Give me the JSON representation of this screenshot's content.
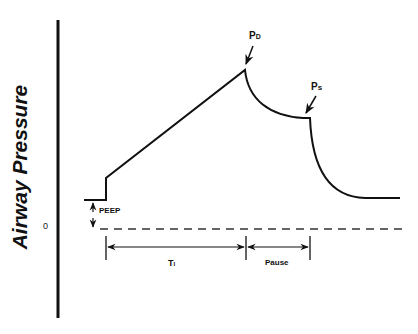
{
  "diagram": {
    "y_axis_label": "Airway Pressure",
    "zero_label": "0",
    "labels": {
      "peak_pressure": {
        "main": "P",
        "sub": "D"
      },
      "plateau_pressure": {
        "main": "P",
        "sub": "s"
      },
      "peep": "PEEP",
      "inspiratory_time": {
        "main": "T",
        "sub": "I"
      },
      "pause": "Pause"
    },
    "colors": {
      "line": "#111111",
      "background": "#ffffff"
    }
  }
}
